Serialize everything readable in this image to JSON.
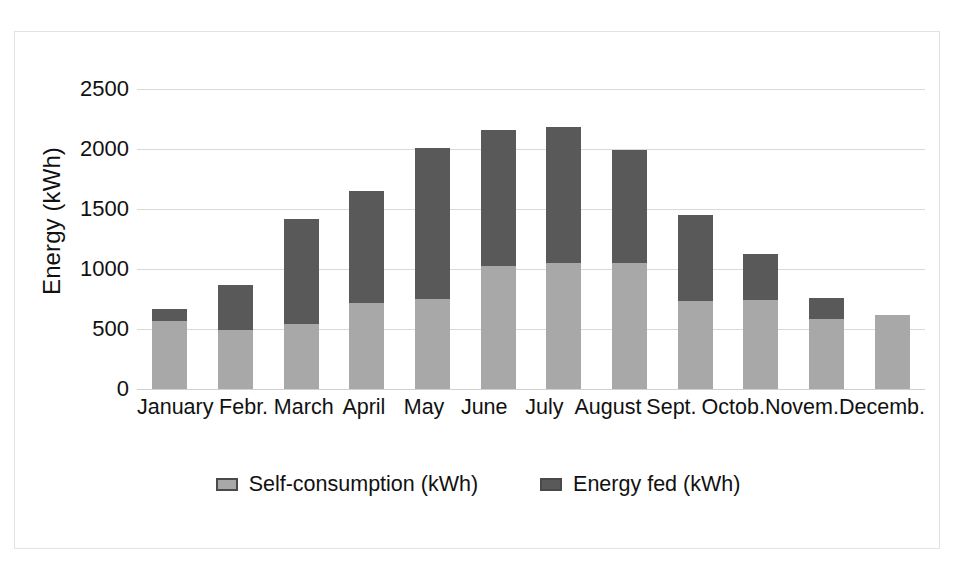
{
  "chart_data": {
    "type": "bar",
    "title": "",
    "xlabel": "",
    "ylabel": "Energy (kWh)",
    "ylim": [
      0,
      2500
    ],
    "yticks": [
      "0",
      "500",
      "1000",
      "1500",
      "2000",
      "2500"
    ],
    "grid": true,
    "stacked": true,
    "legend_position": "bottom",
    "categories": [
      "January",
      "Febr.",
      "March",
      "April",
      "May",
      "June",
      "July",
      "August",
      "Sept.",
      "Octob.",
      "Novem.",
      "Decemb."
    ],
    "series": [
      {
        "name": "Self-consumption (kWh)",
        "color": "#a8a8a8",
        "values": [
          563,
          494,
          543,
          716,
          750,
          1026,
          1046,
          1052,
          730,
          738,
          580,
          620
        ]
      },
      {
        "name": "Energy fed (kWh)",
        "color": "#595959",
        "values": [
          103,
          374,
          877,
          933,
          1255,
          1131,
          1135,
          936,
          718,
          388,
          179,
          0
        ]
      }
    ],
    "totals": [
      666,
      868,
      1420,
      1649,
      2005,
      2157,
      2181,
      1988,
      1448,
      1126,
      759,
      620
    ]
  },
  "legend": {
    "items": [
      {
        "label": "Self-consumption (kWh)",
        "swatch": "self"
      },
      {
        "label": "Energy fed (kWh)",
        "swatch": "fed"
      }
    ]
  },
  "colors": {
    "self_consumption": "#a8a8a8",
    "energy_fed": "#595959",
    "gridline": "#d9d9d9",
    "frame_border": "#e2e2e2"
  }
}
